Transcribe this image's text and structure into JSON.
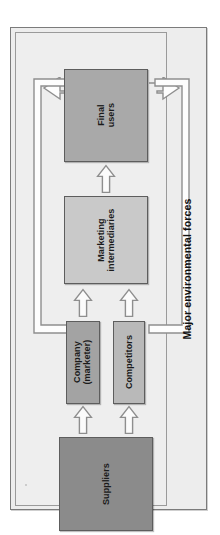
{
  "diagram": {
    "title": "Major environmental forces",
    "orientation": "rotated-90-ccw",
    "frame": {
      "background_color": "#ededed",
      "border_color": "#7b7b7b"
    },
    "caption": {
      "text": "Major environmental forces",
      "color": "#101010"
    },
    "nodes": [
      {
        "id": "final-users",
        "label": "Final users",
        "label_lines": [
          "Final",
          "users"
        ],
        "fill_color": "#a9a9a9",
        "border_color": "#5d5d5d"
      },
      {
        "id": "marketing-intermediaries",
        "label": "Marketing intermediaries",
        "label_lines": [
          "Marketing",
          "intermediaries"
        ],
        "fill_color": "#c9c9c9",
        "border_color": "#5d5d5d"
      },
      {
        "id": "company-marketer",
        "label": "Company (marketer)",
        "label_lines": [
          "Company",
          "(marketer)"
        ],
        "fill_color": "#a3a3a3",
        "border_color": "#5d5d5d"
      },
      {
        "id": "competitors",
        "label": "Competitors",
        "label_lines": [
          "Competitors"
        ],
        "fill_color": "#b9b9b9",
        "border_color": "#5d5d5d"
      },
      {
        "id": "suppliers",
        "label": "Suppliers",
        "label_lines": [
          "Suppliers"
        ],
        "fill_color": "#8b8b8b",
        "border_color": "#5d5d5d"
      }
    ],
    "flow_arrows": [
      {
        "id": "intermediaries-to-final-users",
        "from": "marketing-intermediaries",
        "to": "final-users",
        "style": "hollow-block-arrow"
      },
      {
        "id": "company-to-intermediaries",
        "from": "company-marketer",
        "to": "marketing-intermediaries",
        "style": "hollow-block-arrow"
      },
      {
        "id": "competitors-to-intermediaries",
        "from": "competitors",
        "to": "marketing-intermediaries",
        "style": "hollow-block-arrow"
      },
      {
        "id": "suppliers-to-company",
        "from": "suppliers",
        "to": "company-marketer",
        "style": "hollow-block-arrow"
      },
      {
        "id": "suppliers-to-competitors",
        "from": "suppliers",
        "to": "competitors",
        "style": "hollow-block-arrow"
      }
    ],
    "feedback_loops": [
      {
        "id": "company-to-final-users-loop",
        "from": "company-marketer",
        "to": "final-users",
        "side": "left",
        "style": "hollow-outline-arrow"
      },
      {
        "id": "competitors-to-final-users-loop",
        "from": "competitors",
        "to": "final-users",
        "side": "right",
        "style": "hollow-outline-arrow"
      }
    ]
  }
}
